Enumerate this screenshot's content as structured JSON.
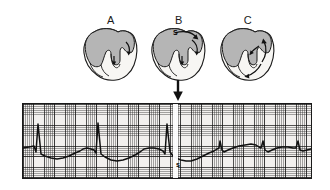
{
  "figure": {
    "panels": [
      {
        "id": "A",
        "label": "A",
        "left": 101,
        "top": 14
      },
      {
        "id": "B",
        "label": "B",
        "left": 169,
        "top": 14
      },
      {
        "id": "C",
        "label": "C",
        "left": 238,
        "top": 14
      }
    ],
    "hearts": [
      {
        "id": "heart-a",
        "left": 78,
        "top": 26,
        "marker": "",
        "description": "normal-conduction"
      },
      {
        "id": "heart-b",
        "left": 146,
        "top": 26,
        "marker": "S",
        "marker_left": 173,
        "marker_top": 29,
        "description": "stimulus-applied"
      },
      {
        "id": "heart-c",
        "left": 215,
        "top": 26,
        "marker": "",
        "description": "re-entry-circuit"
      }
    ],
    "arrow": {
      "name": "stimulus-pointer-arrow",
      "left": 172,
      "top": 80
    },
    "colors": {
      "myocardium_fill": "#b5b5b5",
      "chamber_fill": "#f7f6f3",
      "outline": "#1a1a1a",
      "ecg_paper": "#f2f0ee",
      "ecg_grid_minor": "#4a4a4a",
      "ecg_grid_major": "#1f1f1f",
      "ecg_trace": "#111111",
      "stimulus_band": "#ffffff"
    }
  },
  "chart_data": {
    "type": "line",
    "title": "",
    "subtitle": "",
    "xlabel": "",
    "ylabel": "",
    "grid": true,
    "legend_position": "none",
    "xlim": [
      0,
      288
    ],
    "ylim": [
      0,
      74
    ],
    "baseline_y": 46,
    "annotations": [
      {
        "text": "s",
        "x": 153,
        "y": 57,
        "name": "stimulus-marker-label"
      }
    ],
    "stimulus_band": {
      "x": 150,
      "width": 5,
      "color": "#ffffff"
    },
    "events": [
      {
        "name": "R-wave-1",
        "x": 15,
        "amplitude_y": 20,
        "type": "tall-qrs"
      },
      {
        "name": "T-wave-1",
        "x": 58,
        "amplitude_y": 38,
        "type": "t-wave"
      },
      {
        "name": "R-wave-2",
        "x": 75,
        "amplitude_y": 19,
        "type": "tall-qrs"
      },
      {
        "name": "T-wave-2",
        "x": 118,
        "amplitude_y": 38,
        "type": "t-wave"
      },
      {
        "name": "R-wave-3",
        "x": 144,
        "amplitude_y": 20,
        "type": "tall-qrs"
      },
      {
        "name": "T-wave-3",
        "x": 182,
        "amplitude_y": 42,
        "type": "t-wave"
      },
      {
        "name": "R-wave-4",
        "x": 197,
        "amplitude_y": 37,
        "type": "small-qrs"
      },
      {
        "name": "T-wave-4",
        "x": 228,
        "amplitude_y": 40,
        "type": "t-wave"
      },
      {
        "name": "R-wave-5",
        "x": 240,
        "amplitude_y": 37,
        "type": "small-qrs"
      },
      {
        "name": "T-wave-5",
        "x": 262,
        "amplitude_y": 42,
        "type": "t-wave"
      },
      {
        "name": "R-wave-6",
        "x": 275,
        "amplitude_y": 37,
        "type": "small-qrs"
      }
    ],
    "series": [
      {
        "name": "ecg-lead",
        "path": "M 0,44 L 6,43 L 11,42 L 13,48 L 15,20 L 18,50 L 22,52 L 28,54 L 34,55 L 40,54 L 46,52 L 52,49 L 57,47 L 60,45 L 64,44 L 68,45 L 71,46 L 73,49 L 75,19 L 78,50 L 82,53 L 88,56 L 94,57 L 100,56 L 106,54 L 112,51 L 117,48 L 121,45 L 126,44 L 131,44 L 136,45 L 140,47 L 142,50 L 144,20 L 147,48 L 150,52 L 153,54 L 158,56 L 163,57 L 168,57 L 174,55 L 180,52 L 186,49 L 191,47 L 194,45 L 196,44 L 197,37 L 199,46 L 201,48 L 205,46 L 210,44 L 216,42 L 222,41 L 228,40 L 233,41 L 236,43 L 238,44 L 240,37 L 242,46 L 245,48 L 249,46 L 254,44 L 259,43 L 265,43 L 270,44 L 273,44 L 275,37 L 277,46 L 280,47 L 284,46 L 288,45"
      }
    ]
  }
}
